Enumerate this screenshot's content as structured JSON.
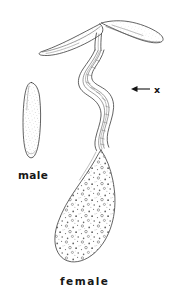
{
  "figure": {
    "background_color": "#ffffff",
    "ink_color": "#3b3b3b",
    "label_color": "#171717",
    "annotation_color": "#141414",
    "specimens": [
      {
        "id": "male",
        "label": "male",
        "label_position": {
          "x": 18,
          "y": 175
        },
        "description": "elongated stippled oval body",
        "texture": "fine-stipple"
      },
      {
        "id": "female",
        "label": "female",
        "label_position": {
          "x": 62,
          "y": 282
        },
        "description": "slender sinuous anterior tube expanding into a large teardrop body filled with eggs, with bifurcated anterior wings",
        "texture": "coarse-stipple-eggs"
      }
    ],
    "annotations": [
      {
        "id": "marker-x",
        "label": "x",
        "icon": "left-arrow-icon",
        "label_position": {
          "x": 155,
          "y": 93
        },
        "arrow_from": {
          "x": 150,
          "y": 89
        },
        "arrow_to": {
          "x": 131,
          "y": 89
        },
        "points_at": "neck-tube-wall"
      }
    ]
  }
}
